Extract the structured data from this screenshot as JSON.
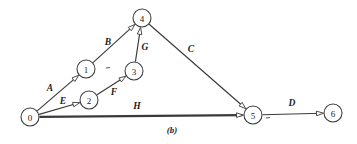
{
  "figure": {
    "caption": "(b)",
    "caption_x": 172,
    "caption_y": 130,
    "background_color": "#ffffff",
    "ink_color": "#3a3a3a"
  },
  "chart_data": {
    "type": "diagram",
    "title": "(b)",
    "nodes": [
      {
        "id": "0",
        "label": "0",
        "x": 30,
        "y": 117,
        "r": 9
      },
      {
        "id": "1",
        "label": "1",
        "x": 86,
        "y": 69,
        "r": 9
      },
      {
        "id": "2",
        "label": "2",
        "x": 89,
        "y": 100,
        "r": 9
      },
      {
        "id": "3",
        "label": "3",
        "x": 134,
        "y": 71,
        "r": 9
      },
      {
        "id": "4",
        "label": "4",
        "x": 142,
        "y": 18,
        "r": 9
      },
      {
        "id": "5",
        "label": "5",
        "x": 253,
        "y": 115,
        "r": 9
      },
      {
        "id": "6",
        "label": "6",
        "x": 333,
        "y": 113,
        "r": 9
      }
    ],
    "edges": [
      {
        "label": "A",
        "from": "0",
        "to": "1",
        "label_x": 50,
        "label_y": 88,
        "thick": false
      },
      {
        "label": "B",
        "from": "1",
        "to": "4",
        "label_x": 108,
        "label_y": 42,
        "thick": false
      },
      {
        "label": "E",
        "from": "0",
        "to": "2",
        "label_x": 63,
        "label_y": 101,
        "thick": false
      },
      {
        "label": "F",
        "from": "2",
        "to": "3",
        "label_x": 114,
        "label_y": 92,
        "thick": false
      },
      {
        "label": "G",
        "from": "3",
        "to": "4",
        "label_x": 145,
        "label_y": 47,
        "thick": false
      },
      {
        "label": "C",
        "from": "4",
        "to": "5",
        "label_x": 191,
        "label_y": 49,
        "thick": false
      },
      {
        "label": "H",
        "from": "0",
        "to": "5",
        "label_x": 137,
        "label_y": 106,
        "thick": true
      },
      {
        "label": "D",
        "from": "5",
        "to": "6",
        "label_x": 292,
        "label_y": 103,
        "thick": false
      }
    ],
    "tick_marks": [
      {
        "x": 108,
        "y": 68
      },
      {
        "x": 268,
        "y": 118
      }
    ],
    "node_labels": [
      "0",
      "1",
      "2",
      "3",
      "4",
      "5",
      "6"
    ],
    "edge_labels": [
      "A",
      "B",
      "C",
      "D",
      "E",
      "F",
      "G",
      "H"
    ],
    "xlabel": "",
    "ylabel": ""
  }
}
